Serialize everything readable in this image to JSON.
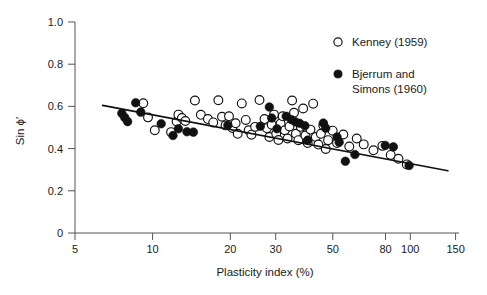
{
  "chart_data": {
    "type": "scatter",
    "title": "",
    "xlabel": "Plasticity index (%)",
    "ylabel": "Sin ϕ′",
    "xscale": "log",
    "yscale": "linear",
    "xlim": [
      5,
      150
    ],
    "ylim": [
      0,
      1.0
    ],
    "grid": false,
    "xticks": [
      5,
      10,
      20,
      30,
      50,
      80,
      100,
      150
    ],
    "xticklabels": [
      "5",
      "10",
      "20",
      "30",
      "50",
      "80",
      "100",
      "150"
    ],
    "yticks": [
      0,
      0.2,
      0.4,
      0.6,
      0.8,
      1.0
    ],
    "yticklabels": [
      "0",
      "0.2",
      "0.4",
      "0.6",
      "0.8",
      "1.0"
    ],
    "legend_position": "top-right",
    "series": [
      {
        "name": "Kenney (1959)",
        "marker": "open-circle",
        "color": "#ffffff",
        "edge_color": "#111111",
        "points": [
          [
            9.2,
            0.615
          ],
          [
            9.6,
            0.548
          ],
          [
            10.2,
            0.487
          ],
          [
            11.8,
            0.478
          ],
          [
            12.4,
            0.528
          ],
          [
            12.6,
            0.561
          ],
          [
            13.0,
            0.545
          ],
          [
            13.4,
            0.531
          ],
          [
            14.6,
            0.628
          ],
          [
            15.4,
            0.56
          ],
          [
            16.4,
            0.54
          ],
          [
            17.2,
            0.524
          ],
          [
            18.0,
            0.629
          ],
          [
            18.6,
            0.551
          ],
          [
            19.2,
            0.51
          ],
          [
            19.8,
            0.553
          ],
          [
            20.4,
            0.498
          ],
          [
            21.0,
            0.52
          ],
          [
            21.4,
            0.47
          ],
          [
            22.2,
            0.614
          ],
          [
            23.0,
            0.536
          ],
          [
            23.6,
            0.487
          ],
          [
            24.2,
            0.466
          ],
          [
            25.0,
            0.503
          ],
          [
            26.0,
            0.63
          ],
          [
            27.2,
            0.54
          ],
          [
            27.8,
            0.497
          ],
          [
            28.4,
            0.455
          ],
          [
            29.0,
            0.513
          ],
          [
            29.6,
            0.561
          ],
          [
            30.2,
            0.47
          ],
          [
            30.8,
            0.441
          ],
          [
            31.4,
            0.519
          ],
          [
            32.0,
            0.553
          ],
          [
            32.6,
            0.487
          ],
          [
            33.4,
            0.448
          ],
          [
            34.0,
            0.505
          ],
          [
            34.8,
            0.628
          ],
          [
            35.4,
            0.57
          ],
          [
            36.0,
            0.47
          ],
          [
            36.8,
            0.44
          ],
          [
            37.6,
            0.503
          ],
          [
            38.4,
            0.59
          ],
          [
            39.2,
            0.462
          ],
          [
            40.0,
            0.427
          ],
          [
            41.0,
            0.49
          ],
          [
            42.0,
            0.613
          ],
          [
            43.0,
            0.455
          ],
          [
            44.0,
            0.419
          ],
          [
            45.0,
            0.47
          ],
          [
            46.0,
            0.509
          ],
          [
            47.0,
            0.398
          ],
          [
            48.0,
            0.44
          ],
          [
            50.0,
            0.485
          ],
          [
            52.0,
            0.427
          ],
          [
            55.0,
            0.467
          ],
          [
            58.0,
            0.41
          ],
          [
            62.0,
            0.448
          ],
          [
            66.0,
            0.42
          ],
          [
            72.0,
            0.392
          ],
          [
            78.0,
            0.413
          ],
          [
            84.0,
            0.37
          ],
          [
            90.0,
            0.352
          ],
          [
            97.0,
            0.325
          ]
        ]
      },
      {
        "name": "Bjerrum and Simons (1960)",
        "marker": "filled-circle",
        "color": "#111111",
        "edge_color": "#111111",
        "points": [
          [
            7.6,
            0.567
          ],
          [
            7.8,
            0.547
          ],
          [
            8.0,
            0.528
          ],
          [
            8.6,
            0.617
          ],
          [
            9.0,
            0.573
          ],
          [
            10.8,
            0.518
          ],
          [
            12.0,
            0.462
          ],
          [
            12.6,
            0.494
          ],
          [
            13.6,
            0.48
          ],
          [
            14.4,
            0.478
          ],
          [
            19.6,
            0.511
          ],
          [
            26.2,
            0.506
          ],
          [
            28.4,
            0.597
          ],
          [
            29.0,
            0.545
          ],
          [
            30.4,
            0.494
          ],
          [
            33.0,
            0.553
          ],
          [
            34.6,
            0.537
          ],
          [
            35.8,
            0.527
          ],
          [
            37.2,
            0.52
          ],
          [
            39.0,
            0.508
          ],
          [
            40.0,
            0.44
          ],
          [
            46.0,
            0.521
          ],
          [
            47.0,
            0.497
          ],
          [
            52.0,
            0.455
          ],
          [
            53.0,
            0.43
          ],
          [
            56.0,
            0.34
          ],
          [
            61.0,
            0.372
          ],
          [
            80.0,
            0.415
          ],
          [
            86.0,
            0.408
          ],
          [
            99.0,
            0.32
          ]
        ]
      }
    ],
    "trend_line": {
      "name": "best-fit-line",
      "x_start": 6.4,
      "y_start": 0.605,
      "x_end": 140.0,
      "y_end": 0.295
    }
  },
  "legend": {
    "entries": [
      {
        "label": "Kenney (1959)",
        "marker": "open-circle"
      },
      {
        "label": "Bjerrum and",
        "label2": "Simons (1960)",
        "marker": "filled-circle"
      }
    ]
  },
  "axes": {
    "x_title": "Plasticity index (%)",
    "y_title": "Sin ϕ′"
  },
  "colors": {
    "background": "#ffffff",
    "axis": "#555555",
    "ink": "#111111",
    "text": "#1a1a1a"
  }
}
